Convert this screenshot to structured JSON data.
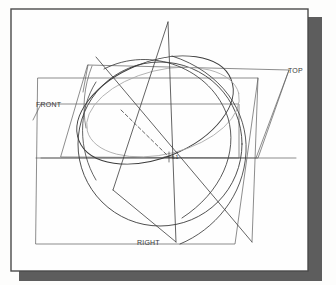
{
  "document": {
    "type": "scanned-technical-drawing",
    "title": "Orthographic Projection Drawing",
    "page_background": "#fdfdfc",
    "paper_background": "#fefefe",
    "shadow_color": "#5a5a5a",
    "border_color": "#4a4a4a"
  },
  "labels": {
    "top": "TOP",
    "front": "FRONT",
    "right": "RIGHT",
    "center_point": "L1"
  },
  "colors": {
    "line_dark": "#3c3c3c",
    "line_medium": "#5c5c5c",
    "line_light": "#9a9a9a",
    "line_gray_arc": "#a8a8a8",
    "text": "#3a3a3a"
  },
  "geometry": {
    "paper": {
      "x": 11,
      "y": 9,
      "width": 297,
      "height": 262
    },
    "shadow": {
      "x": 19,
      "y": 17,
      "width": 303,
      "height": 264
    },
    "sphere": {
      "cx": 160,
      "cy": 144,
      "r": 82
    },
    "ellipse_main": {
      "cx": 155,
      "cy": 110,
      "rx": 82,
      "ry": 48,
      "rotation": -22
    },
    "ellipse_gray": {
      "cx": 163,
      "cy": 112,
      "rx": 78,
      "ry": 42,
      "rotation": -14
    },
    "cone_apex": {
      "x": 168,
      "y": 22
    },
    "cone_base_left": {
      "x": 113,
      "y": 190
    },
    "cone_base_right": {
      "x": 176,
      "y": 242
    },
    "plane_top": {
      "points": "88,65 289,70 258,158 61,157"
    },
    "plane_front": {
      "points": "41,104 239,104 239,158 41,158"
    },
    "plane_right": {
      "points": "38,78 258,78 235,244 36,244"
    },
    "center": {
      "x": 169,
      "y": 157
    }
  }
}
